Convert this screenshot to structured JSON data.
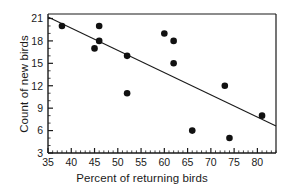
{
  "chart_data": {
    "type": "scatter",
    "title": "",
    "xlabel": "Percent of returning birds",
    "ylabel": "Count of new birds",
    "xlim": [
      35,
      84
    ],
    "ylim": [
      3,
      21.6
    ],
    "grid": false,
    "legend": "none",
    "x_ticks": [
      35,
      40,
      45,
      50,
      55,
      60,
      65,
      70,
      75,
      80
    ],
    "x_tick_labels": [
      "35",
      "40",
      "45",
      "50",
      "55",
      "60",
      "65",
      "70",
      "75",
      "80"
    ],
    "x_minor_tick_step": 1,
    "y_ticks": [
      3,
      6,
      9,
      12,
      15,
      18,
      21
    ],
    "y_tick_labels": [
      "3",
      "6",
      "9",
      "12",
      "15",
      "18",
      "21"
    ],
    "y_minor_tick_step": 1,
    "marker": "filled-circle",
    "marker_color": "#111111",
    "marker_size_px": 5,
    "points": [
      {
        "x": 38,
        "y": 20
      },
      {
        "x": 45,
        "y": 17
      },
      {
        "x": 46,
        "y": 20
      },
      {
        "x": 46,
        "y": 18
      },
      {
        "x": 52,
        "y": 16
      },
      {
        "x": 52,
        "y": 11
      },
      {
        "x": 60,
        "y": 19
      },
      {
        "x": 62,
        "y": 18
      },
      {
        "x": 62,
        "y": 15
      },
      {
        "x": 66,
        "y": 6
      },
      {
        "x": 73,
        "y": 12
      },
      {
        "x": 74,
        "y": 5
      },
      {
        "x": 81,
        "y": 8
      }
    ],
    "trend_line": {
      "type": "linear-fit",
      "color": "#1a1a1a",
      "x_start": 35,
      "y_start": 21.2,
      "x_end": 84,
      "y_end": 6.6
    }
  },
  "axes": {
    "x_title": "Percent of returning birds",
    "y_title": "Count of new birds"
  }
}
